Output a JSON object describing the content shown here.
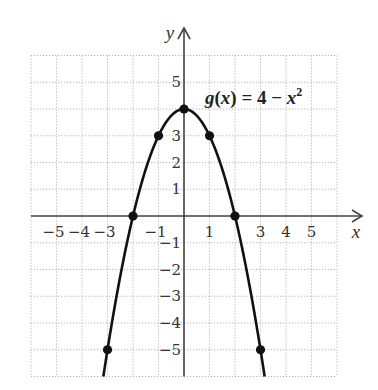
{
  "chart_data": {
    "type": "line",
    "title": "",
    "function_label": {
      "name": "g",
      "variable": "x",
      "expression": "g(x) = 4 − x²",
      "parts": {
        "fn": "g",
        "open": "(",
        "var": "x",
        "close": ")",
        "eq": " = 4 − ",
        "var2": "x",
        "exp": "2"
      }
    },
    "xlabel": "x",
    "ylabel": "y",
    "xlim": [
      -6,
      6
    ],
    "ylim": [
      -6,
      6
    ],
    "grid": true,
    "grid_style": "dotted",
    "x_tick_labels": [
      -5,
      -4,
      -3,
      -1,
      1,
      3,
      4,
      5
    ],
    "y_tick_labels": [
      5,
      3,
      2,
      1,
      -1,
      -2,
      -3,
      -4,
      -5
    ],
    "series": [
      {
        "name": "g(x) = 4 - x^2",
        "curve_domain": [
          -3.1623,
          3.1623
        ],
        "points": [
          {
            "x": -3,
            "y": -5
          },
          {
            "x": -2,
            "y": 0
          },
          {
            "x": -1,
            "y": 3
          },
          {
            "x": 0,
            "y": 4
          },
          {
            "x": 1,
            "y": 3
          },
          {
            "x": 2,
            "y": 0
          },
          {
            "x": 3,
            "y": -5
          }
        ]
      }
    ],
    "colors": {
      "curve": "#111111",
      "axes": "#444444",
      "grid": "#b5b5b5",
      "text": "#333333"
    }
  }
}
